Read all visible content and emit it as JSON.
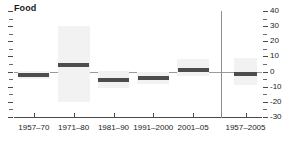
{
  "chart_data": {
    "type": "bar",
    "title": "Food",
    "subtitle": "",
    "xlabel": "",
    "ylabel": "",
    "ylim": [
      -30,
      40
    ],
    "ytick_values": [
      -30,
      -20,
      -10,
      0,
      10,
      20,
      30,
      40
    ],
    "ytick_labels": [
      "-30",
      "-20",
      "-10",
      "0",
      "10",
      "20",
      "30",
      "40"
    ],
    "yminor_step": 5,
    "grid": false,
    "legend": "none",
    "zero_line": true,
    "categories": [
      "1957–70",
      "1971–80",
      "1981–90",
      "1991–2000",
      "2001–05",
      "1957–2005"
    ],
    "values": [
      -2.3,
      4.3,
      -5.7,
      -4.3,
      1.0,
      -1.7
    ],
    "series": [
      {
        "name": "point estimate",
        "values": [
          -2.3,
          4.3,
          -5.7,
          -4.3,
          1.0,
          -1.7
        ]
      },
      {
        "name": "range band low",
        "values": [
          -5.0,
          -20.0,
          -11.0,
          -8.0,
          -3.0,
          -9.0
        ]
      },
      {
        "name": "range band high",
        "values": [
          0.5,
          30.0,
          0.5,
          0.0,
          8.0,
          9.0
        ]
      }
    ],
    "separator_after_category_index": 4,
    "colors": {
      "point": "#4d4d4d",
      "band": "#f2f2f2",
      "axis": "#4a4a4a",
      "zero_line": "#9a9a9a",
      "separator": "#8d8d8d",
      "text": "#1a1a1a",
      "background": "#ffffff"
    }
  }
}
